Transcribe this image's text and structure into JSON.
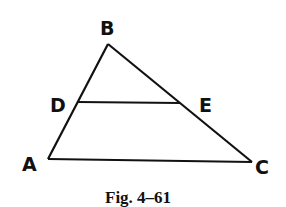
{
  "figure": {
    "caption": "Fig. 4–61",
    "points": {
      "A": {
        "label": "A",
        "x": 48,
        "y": 159
      },
      "B": {
        "label": "B",
        "x": 108,
        "y": 44
      },
      "C": {
        "label": "C",
        "x": 252,
        "y": 162
      },
      "D": {
        "label": "D",
        "x": 78,
        "y": 102
      },
      "E": {
        "label": "E",
        "x": 180,
        "y": 103
      }
    },
    "segments": [
      "AB",
      "BC",
      "AC",
      "DE"
    ],
    "stroke_color": "#111111"
  }
}
